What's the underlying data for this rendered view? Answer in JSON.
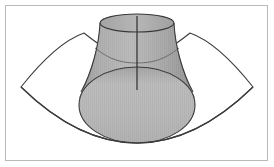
{
  "figure": {
    "type": "geometric-3d-diagram",
    "canvas": {
      "width": 274,
      "height": 167,
      "background": "#ffffff"
    },
    "frame": {
      "name": "outer-border",
      "x": 5.5,
      "y": 5.5,
      "width": 262,
      "height": 155,
      "stroke": "#b9b9b9",
      "stroke_width": 1,
      "fill": "#ffffff"
    },
    "colors": {
      "background": "#ffffff",
      "frame_stroke": "#b9b9b9",
      "outline": "#3a3a3a",
      "cylinder_body": "#a9a9a9",
      "cylinder_body_light": "#bdbdbd",
      "cylinder_body_dark": "#9a9a9a",
      "front_face": "#b6b6b6",
      "front_face_light": "#c4c4c4",
      "front_face_dark": "#a2a2a2",
      "top_cap": "#b0b0b0",
      "sector_fill": "#ffffff",
      "sector_stroke": "#3c3c3c"
    },
    "sector": {
      "name": "curved-fan-surface",
      "description": "Open fan / annular sector shape spanning the figure, drawn in outline only",
      "left_tip": {
        "x": 21,
        "y": 87
      },
      "right_tip": {
        "x": 253,
        "y": 87
      },
      "upper_left_peak": {
        "x": 84,
        "y": 33
      },
      "upper_right_peak": {
        "x": 190,
        "y": 33
      },
      "inner_arc_bottom": {
        "x": 137,
        "y": 70
      },
      "outer_arc_bottom": {
        "x": 137,
        "y": 143
      },
      "stroke_width": 1.1
    },
    "cylinder": {
      "name": "tilted-cylinder",
      "description": "Oblique cylinder rising from lower-front to upper-back",
      "top_cap": {
        "center": {
          "x": 137,
          "y": 23
        },
        "rx": 37,
        "ry": 9
      },
      "front_ellipse": {
        "center": {
          "x": 137,
          "y": 105
        },
        "rx": 58,
        "ry": 38
      },
      "axis_line": {
        "x": 137,
        "y_top": 16,
        "y_bottom": 90
      },
      "intersection_curve_y": 55,
      "stroke_width": 1.1
    },
    "labels": {
      "figure_caption": "",
      "axis_label": "",
      "annotation": ""
    }
  }
}
